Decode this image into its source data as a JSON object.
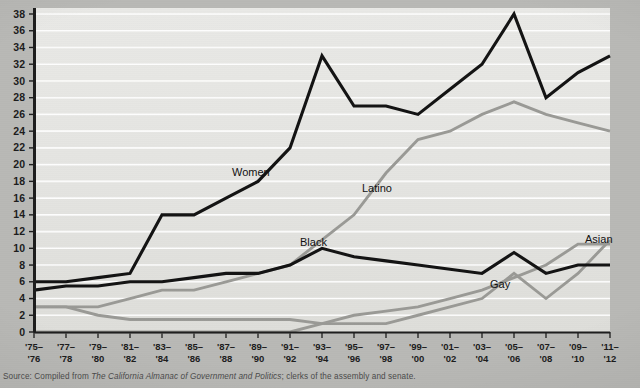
{
  "source": {
    "prefix": "Source: Compiled from ",
    "italic_title": "The California Almanac of Government and Politics",
    "suffix": "; clerks of the assembly and senate."
  },
  "axes": {
    "y_ticks": [
      "0",
      "2",
      "4",
      "6",
      "8",
      "10",
      "12",
      "14",
      "16",
      "18",
      "20",
      "22",
      "24",
      "26",
      "28",
      "30",
      "32",
      "34",
      "36",
      "38"
    ],
    "x_ticks_top": [
      "'75–",
      "'77–",
      "'79–",
      "'81–",
      "'83–",
      "'85–",
      "'87–",
      "'89–",
      "'91–",
      "'93–",
      "'95–",
      "'97–",
      "'99–",
      "'01–",
      "'03–",
      "'05–",
      "'07–",
      "'09–",
      "'11–"
    ],
    "x_ticks_bottom": [
      "'76",
      "'78",
      "'80",
      "'82",
      "'84",
      "'86",
      "'88",
      "'90",
      "'92",
      "'94",
      "'96",
      "'98",
      "'00",
      "'02",
      "'04",
      "'06",
      "'08",
      "'10",
      "'12"
    ]
  },
  "colors": {
    "dark_line": "#131313",
    "gray_line": "#9a9a96",
    "plot_bg": "#e7e7e4",
    "page_bg": "#b9b9b6",
    "gridline": "#ffffff"
  },
  "annotations": [
    {
      "text": "Women",
      "x": 232,
      "y": 176
    },
    {
      "text": "Latino",
      "x": 362,
      "y": 192
    },
    {
      "text": "Black",
      "x": 300,
      "y": 246
    },
    {
      "text": "Gay",
      "x": 490,
      "y": 288
    },
    {
      "text": "Asian",
      "x": 585,
      "y": 243
    }
  ],
  "chart_data": {
    "type": "line",
    "title": "",
    "subtitle": "",
    "xlabel": "",
    "ylabel": "",
    "ylim": [
      0,
      38
    ],
    "ytick_step": 2,
    "grid": "horizontal",
    "legend": "inline-labels",
    "categories": [
      "'75–'76",
      "'77–'78",
      "'79–'80",
      "'81–'82",
      "'83–'84",
      "'85–'86",
      "'87–'88",
      "'89–'90",
      "'91–'92",
      "'93–'94",
      "'95–'96",
      "'97–'98",
      "'99–'00",
      "'01–'02",
      "'03–'04",
      "'05–'06",
      "'07–'08",
      "'09–'10",
      "'11–'12"
    ],
    "series": [
      {
        "name": "Women",
        "color": "#131313",
        "values": [
          6,
          6,
          6.5,
          7,
          14,
          14,
          16,
          18,
          22,
          33,
          27,
          27,
          26,
          29,
          32,
          38,
          28,
          31,
          33
        ]
      },
      {
        "name": "Latino",
        "color": "#9a9a96",
        "values": [
          3,
          3,
          3,
          4,
          5,
          5,
          6,
          7,
          8,
          11,
          14,
          19,
          23,
          24,
          26,
          27.5,
          26,
          25,
          24
        ]
      },
      {
        "name": "Black",
        "color": "#131313",
        "values": [
          5,
          5.5,
          5.5,
          6,
          6,
          6.5,
          7,
          7,
          8,
          10,
          9,
          8.5,
          8,
          7.5,
          7,
          9.5,
          7,
          8,
          8
        ]
      },
      {
        "name": "Gay",
        "color": "#9a9a96",
        "values": [
          0,
          0,
          0,
          0,
          0,
          0,
          0,
          0,
          0,
          1,
          2,
          2.5,
          3,
          4,
          5,
          6.5,
          8,
          10.5,
          10.5
        ]
      },
      {
        "name": "Asian",
        "color": "#9a9a96",
        "values": [
          3,
          3,
          2,
          1.5,
          1.5,
          1.5,
          1.5,
          1.5,
          1.5,
          1,
          1,
          1,
          2,
          3,
          4,
          7,
          4,
          7,
          11
        ]
      }
    ]
  }
}
